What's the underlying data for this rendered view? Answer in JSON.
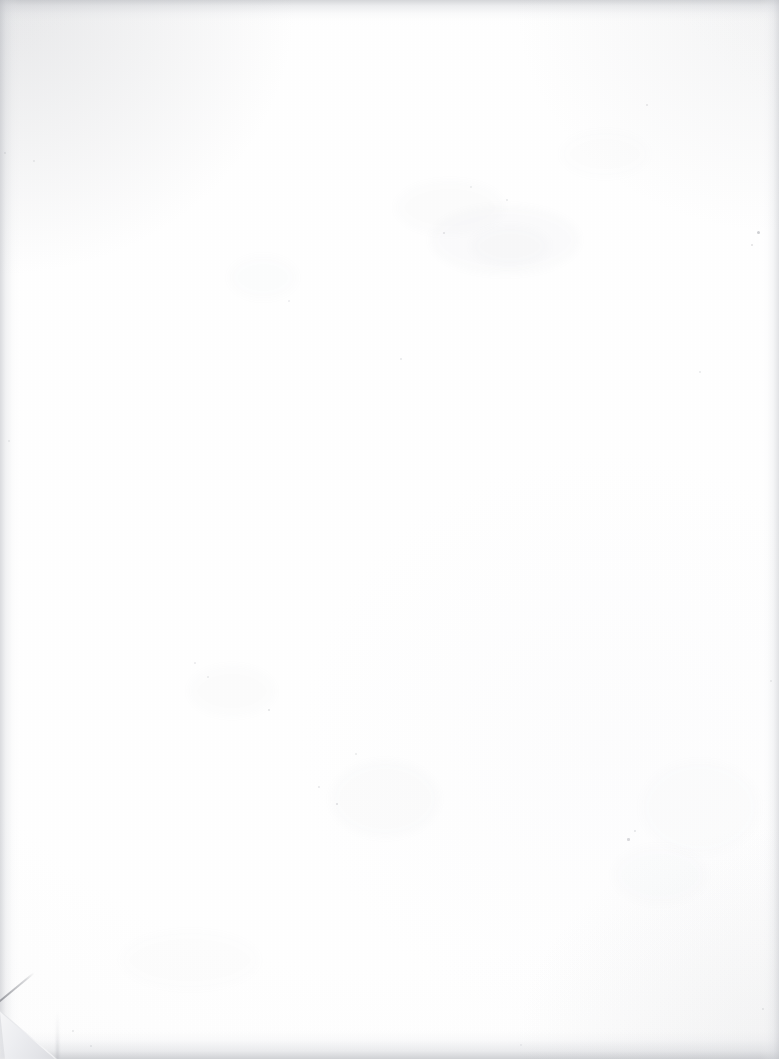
{
  "document": {
    "type": "scanned-page",
    "content_text": "",
    "page_width_px": 779,
    "page_height_px": 1059,
    "orientation": "portrait",
    "is_blank": true,
    "description": "Blank scanned sheet of paper with no printed text, headings, figures or page number visible."
  },
  "appearance": {
    "paper_color": "#fefefe",
    "paper_tint": "#fbfbfc",
    "edge_shadow_color": "#c4c6ca",
    "grain_color": "#000000",
    "background_color": "#ffffff"
  },
  "artifacts": {
    "edge_shadows": [
      {
        "name": "top-edge-shadow",
        "edge": "top",
        "thickness_px": 26,
        "color": "#c4c6ca"
      },
      {
        "name": "bottom-edge-shadow",
        "edge": "bottom",
        "thickness_px": 34,
        "color": "#bcbec3"
      },
      {
        "name": "left-edge-shadow",
        "edge": "left",
        "thickness_px": 22,
        "color": "#c4c6cb"
      },
      {
        "name": "right-edge-shadow",
        "edge": "right",
        "thickness_px": 20,
        "color": "#c8cacf"
      }
    ],
    "dog_ear": {
      "name": "folded-corner",
      "corner": "bottom-left",
      "width_px": 62,
      "height_px": 64,
      "crease_angle_deg": -39.5,
      "flap_color": "#eef0f2",
      "backing_color": "#dedfe3",
      "crease_color": "#8a8c93"
    },
    "smudges": [
      {
        "x": 430,
        "y": 205,
        "w": 150,
        "h": 70,
        "opacity": 0.03,
        "color": "#9aa0ac"
      },
      {
        "x": 395,
        "y": 180,
        "w": 110,
        "h": 55,
        "opacity": 0.024,
        "color": "#a3a8b2"
      },
      {
        "x": 470,
        "y": 225,
        "w": 80,
        "h": 42,
        "opacity": 0.026,
        "color": "#9ea4ae"
      },
      {
        "x": 330,
        "y": 760,
        "w": 110,
        "h": 78,
        "opacity": 0.028,
        "color": "#a0a6b0"
      },
      {
        "x": 188,
        "y": 665,
        "w": 88,
        "h": 52,
        "opacity": 0.022,
        "color": "#a6abb4"
      },
      {
        "x": 612,
        "y": 845,
        "w": 96,
        "h": 60,
        "opacity": 0.02,
        "color": "#a4a9b3"
      },
      {
        "x": 640,
        "y": 760,
        "w": 120,
        "h": 95,
        "opacity": 0.018,
        "color": "#a8adb6"
      },
      {
        "x": 120,
        "y": 930,
        "w": 140,
        "h": 60,
        "opacity": 0.016,
        "color": "#abb0b8"
      },
      {
        "x": 228,
        "y": 255,
        "w": 70,
        "h": 45,
        "opacity": 0.018,
        "color": "#a7acb5"
      },
      {
        "x": 560,
        "y": 130,
        "w": 90,
        "h": 48,
        "opacity": 0.016,
        "color": "#a9aeb7"
      }
    ],
    "specks": [
      {
        "x": 757,
        "y": 231,
        "size": 3.0,
        "opacity": 0.42,
        "color": "#8d8f96"
      },
      {
        "x": 751,
        "y": 244,
        "size": 2.2,
        "opacity": 0.3,
        "color": "#9a9ca3"
      },
      {
        "x": 646,
        "y": 104,
        "size": 2.4,
        "opacity": 0.26,
        "color": "#9b9da4"
      },
      {
        "x": 699,
        "y": 371,
        "size": 2.0,
        "opacity": 0.24,
        "color": "#9fa1a8"
      },
      {
        "x": 627,
        "y": 838,
        "size": 2.6,
        "opacity": 0.34,
        "color": "#8f9198"
      },
      {
        "x": 634,
        "y": 830,
        "size": 1.8,
        "opacity": 0.26,
        "color": "#9c9ea5"
      },
      {
        "x": 268,
        "y": 709,
        "size": 2.2,
        "opacity": 0.28,
        "color": "#989aa1"
      },
      {
        "x": 336,
        "y": 803,
        "size": 2.4,
        "opacity": 0.3,
        "color": "#94969d"
      },
      {
        "x": 318,
        "y": 786,
        "size": 1.8,
        "opacity": 0.24,
        "color": "#9ea0a7"
      },
      {
        "x": 355,
        "y": 753,
        "size": 2.0,
        "opacity": 0.22,
        "color": "#a0a2a9"
      },
      {
        "x": 207,
        "y": 676,
        "size": 1.9,
        "opacity": 0.22,
        "color": "#a1a3aa"
      },
      {
        "x": 194,
        "y": 662,
        "size": 1.7,
        "opacity": 0.2,
        "color": "#a4a6ad"
      },
      {
        "x": 400,
        "y": 358,
        "size": 2.1,
        "opacity": 0.24,
        "color": "#9b9da4"
      },
      {
        "x": 443,
        "y": 232,
        "size": 2.3,
        "opacity": 0.26,
        "color": "#96989f"
      },
      {
        "x": 506,
        "y": 199,
        "size": 2.0,
        "opacity": 0.22,
        "color": "#9da0a7"
      },
      {
        "x": 470,
        "y": 186,
        "size": 1.8,
        "opacity": 0.2,
        "color": "#a2a4ab"
      },
      {
        "x": 288,
        "y": 300,
        "size": 1.7,
        "opacity": 0.18,
        "color": "#a6a8af"
      },
      {
        "x": 770,
        "y": 680,
        "size": 2.0,
        "opacity": 0.26,
        "color": "#9a9ca3"
      },
      {
        "x": 762,
        "y": 1008,
        "size": 2.2,
        "opacity": 0.26,
        "color": "#989aa1"
      },
      {
        "x": 90,
        "y": 1045,
        "size": 2.0,
        "opacity": 0.28,
        "color": "#95979e"
      },
      {
        "x": 72,
        "y": 1030,
        "size": 1.8,
        "opacity": 0.24,
        "color": "#9c9ea5"
      },
      {
        "x": 520,
        "y": 1044,
        "size": 1.9,
        "opacity": 0.22,
        "color": "#9fa1a8"
      },
      {
        "x": 33,
        "y": 160,
        "size": 1.8,
        "opacity": 0.22,
        "color": "#a0a2a9"
      },
      {
        "x": 8,
        "y": 440,
        "size": 2.0,
        "opacity": 0.26,
        "color": "#989aa1"
      },
      {
        "x": 4,
        "y": 152,
        "size": 2.4,
        "opacity": 0.3,
        "color": "#909298"
      }
    ]
  }
}
